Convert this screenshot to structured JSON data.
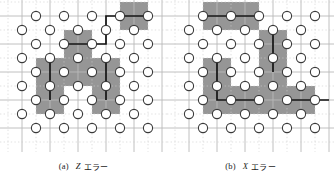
{
  "figure": {
    "style": {
      "background": "#ffffff",
      "grid_color": "#b9b9b9",
      "grid_minor_color": "#cfcfcf",
      "plaquette_fill": "#969696",
      "qubit_fill": "#ffffff",
      "qubit_stroke": "#3a3a3a",
      "chain_color": "#111111",
      "text_color": "#1a1a1a"
    },
    "lattice": {
      "cell": 28,
      "origin_x": 22,
      "origin_y": 16,
      "columns": 5,
      "rows": 5,
      "qubit_radius": 4.6,
      "plaquette_half": 14
    }
  },
  "panels": [
    {
      "id": "panel-a",
      "caption": {
        "tag": "(a)",
        "symbol": "Z",
        "text": "エラー"
      },
      "plaquettes": [
        {
          "cx": 134,
          "cy": 16
        },
        {
          "cx": 78,
          "cy": 44
        },
        {
          "cx": 50,
          "cy": 72
        },
        {
          "cx": 50,
          "cy": 100
        },
        {
          "cx": 106,
          "cy": 72
        },
        {
          "cx": 106,
          "cy": 100
        },
        {
          "cx": 78,
          "cy": 72
        }
      ],
      "chain": [
        {
          "x": 106,
          "y": 16
        },
        {
          "x": 134,
          "y": 16
        },
        {
          "x": 106,
          "y": 16
        },
        {
          "x": 106,
          "y": 44
        },
        {
          "x": 78,
          "y": 44
        }
      ],
      "chain_paths": [
        "M 148 16 L 106 16 L 106 44 L 64 44",
        "M 50 58 L 50 100",
        "M 106 58 L 106 100"
      ],
      "qubits_v": [
        [
          22,
          30
        ],
        [
          50,
          30
        ],
        [
          78,
          30
        ],
        [
          106,
          30
        ],
        [
          134,
          30
        ],
        [
          22,
          58
        ],
        [
          50,
          58
        ],
        [
          78,
          58
        ],
        [
          106,
          58
        ],
        [
          134,
          58
        ],
        [
          22,
          86
        ],
        [
          50,
          86
        ],
        [
          78,
          86
        ],
        [
          106,
          86
        ],
        [
          134,
          86
        ],
        [
          22,
          114
        ],
        [
          50,
          114
        ],
        [
          78,
          114
        ],
        [
          106,
          114
        ],
        [
          134,
          114
        ]
      ],
      "qubits_h": [
        [
          36,
          16
        ],
        [
          64,
          16
        ],
        [
          92,
          16
        ],
        [
          120,
          16
        ],
        [
          148,
          16
        ],
        [
          36,
          44
        ],
        [
          64,
          44
        ],
        [
          92,
          44
        ],
        [
          120,
          44
        ],
        [
          148,
          44
        ],
        [
          36,
          72
        ],
        [
          64,
          72
        ],
        [
          92,
          72
        ],
        [
          120,
          72
        ],
        [
          148,
          72
        ],
        [
          36,
          100
        ],
        [
          64,
          100
        ],
        [
          92,
          100
        ],
        [
          120,
          100
        ],
        [
          148,
          100
        ],
        [
          36,
          128
        ],
        [
          64,
          128
        ],
        [
          92,
          128
        ],
        [
          120,
          128
        ],
        [
          148,
          128
        ]
      ]
    },
    {
      "id": "panel-b",
      "caption": {
        "tag": "(b)",
        "symbol": "X",
        "text": "エラー"
      },
      "plaquettes": [
        {
          "cx": 50,
          "cy": 16
        },
        {
          "cx": 78,
          "cy": 16
        },
        {
          "cx": 106,
          "cy": 44
        },
        {
          "cx": 106,
          "cy": 72
        },
        {
          "cx": 50,
          "cy": 72
        },
        {
          "cx": 50,
          "cy": 100
        },
        {
          "cx": 78,
          "cy": 100
        },
        {
          "cx": 106,
          "cy": 100
        },
        {
          "cx": 134,
          "cy": 100
        }
      ],
      "chain_paths": [
        "M 36 16 L 92 16",
        "M 106 30 L 106 72",
        "M 50 58 L 50 100 L 92 100",
        "M 120 100 L 162 100"
      ],
      "qubits_v": [
        [
          22,
          30
        ],
        [
          50,
          30
        ],
        [
          78,
          30
        ],
        [
          106,
          30
        ],
        [
          134,
          30
        ],
        [
          22,
          58
        ],
        [
          50,
          58
        ],
        [
          78,
          58
        ],
        [
          106,
          58
        ],
        [
          134,
          58
        ],
        [
          22,
          86
        ],
        [
          50,
          86
        ],
        [
          78,
          86
        ],
        [
          106,
          86
        ],
        [
          134,
          86
        ],
        [
          22,
          114
        ],
        [
          50,
          114
        ],
        [
          78,
          114
        ],
        [
          106,
          114
        ],
        [
          134,
          114
        ]
      ],
      "qubits_h": [
        [
          36,
          16
        ],
        [
          64,
          16
        ],
        [
          92,
          16
        ],
        [
          120,
          16
        ],
        [
          148,
          16
        ],
        [
          36,
          44
        ],
        [
          64,
          44
        ],
        [
          92,
          44
        ],
        [
          120,
          44
        ],
        [
          148,
          44
        ],
        [
          36,
          72
        ],
        [
          64,
          72
        ],
        [
          92,
          72
        ],
        [
          120,
          72
        ],
        [
          148,
          72
        ],
        [
          36,
          100
        ],
        [
          64,
          100
        ],
        [
          92,
          100
        ],
        [
          120,
          100
        ],
        [
          148,
          100
        ],
        [
          36,
          128
        ],
        [
          64,
          128
        ],
        [
          92,
          128
        ],
        [
          120,
          128
        ],
        [
          148,
          128
        ]
      ]
    }
  ]
}
